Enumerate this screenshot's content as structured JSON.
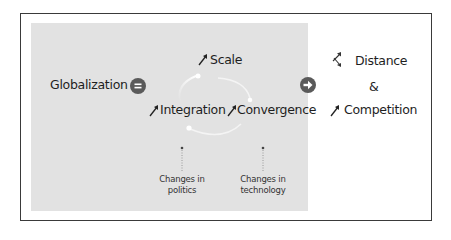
{
  "diagram": {
    "left_label": "Globalization",
    "equals_symbol": "=",
    "cycle": {
      "top": "Scale",
      "left": "Integration",
      "right": "Convergence"
    },
    "drivers": [
      {
        "line1": "Changes in",
        "line2": "politics"
      },
      {
        "line1": "Changes in",
        "line2": "technology"
      }
    ],
    "results": {
      "first": "Distance",
      "connector": "&",
      "second": "Competition"
    },
    "icons": {
      "up_arrow": "up-right-arrow",
      "mixed_arrow": "up-and-down-arrow",
      "implies": "right-arrow-circle"
    },
    "colors": {
      "panel": "#e2e2e2",
      "circle": "#5a5a5a",
      "text": "#1e1e1e",
      "frame": "#3a3a3a"
    }
  }
}
